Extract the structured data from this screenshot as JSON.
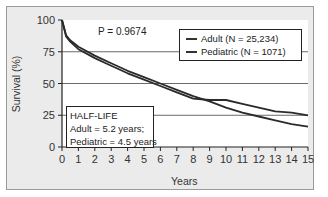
{
  "chart_data": {
    "type": "line",
    "title": "",
    "xlabel": "Years",
    "ylabel": "Survival (%)",
    "xlim": [
      0,
      15
    ],
    "ylim": [
      0,
      100
    ],
    "x_ticks": [
      0,
      1,
      2,
      3,
      4,
      5,
      6,
      7,
      8,
      9,
      10,
      11,
      12,
      13,
      14,
      15
    ],
    "y_ticks": [
      0,
      25,
      50,
      75,
      100
    ],
    "grid": "horizontal at 25, 50, 75",
    "legend_position": "upper right",
    "x": [
      0,
      0.25,
      0.5,
      1,
      2,
      3,
      4,
      5,
      6,
      7,
      8,
      9,
      10,
      11,
      12,
      13,
      14,
      15
    ],
    "series": [
      {
        "name": "Adult (N = 25,234)",
        "values": [
          100,
          88,
          84,
          79,
          72,
          66,
          60,
          55,
          50,
          45,
          40,
          36,
          31,
          27,
          24,
          21,
          18,
          16
        ]
      },
      {
        "name": "Pediatric (N = 1071)",
        "values": [
          100,
          87,
          83,
          77,
          70,
          64,
          58,
          53,
          48,
          43,
          38,
          37,
          37,
          34,
          31,
          28,
          27,
          25
        ]
      }
    ],
    "annotations": [
      "P = 0.9674",
      "HALF-LIFE",
      "Adult = 5.2 years;",
      "Pediatric = 4.5 years"
    ]
  },
  "labels": {
    "p_value": "P = 0.9674",
    "legend": [
      "Adult (N = 25,234)",
      "Pediatric (N = 1071)"
    ],
    "half_life_title": "HALF-LIFE",
    "half_life_adult": "Adult = 5.2 years;",
    "half_life_pediatric": "Pediatric = 4.5 years",
    "x_title": "Years",
    "y_title": "Survival (%)",
    "y_ticks": [
      "100",
      "75",
      "50",
      "25",
      "0"
    ],
    "x_ticks": [
      "0",
      "1",
      "2",
      "3",
      "4",
      "5",
      "6",
      "7",
      "8",
      "9",
      "10",
      "11",
      "12",
      "13",
      "14",
      "15"
    ]
  }
}
